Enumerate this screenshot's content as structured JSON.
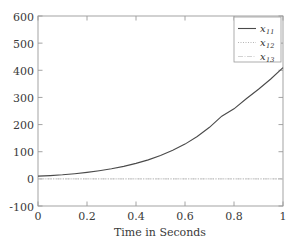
{
  "chart_data": {
    "type": "line",
    "title": "",
    "xlabel": "Time in Seconds",
    "ylabel": "",
    "xlim": [
      0,
      1
    ],
    "ylim": [
      -100,
      600
    ],
    "grid": false,
    "legend_position": "top-right",
    "xticks": [
      "0",
      "0.2",
      "0.4",
      "0.6",
      "0.8",
      "1"
    ],
    "xtick_values": [
      0,
      0.2,
      0.4,
      0.6,
      0.8,
      1
    ],
    "yticks": [
      "600",
      "500",
      "400",
      "300",
      "200",
      "100",
      "0",
      "-100"
    ],
    "ytick_values": [
      600,
      500,
      400,
      300,
      200,
      100,
      0,
      -100
    ],
    "x": [
      0,
      0.05,
      0.1,
      0.15,
      0.2,
      0.25,
      0.3,
      0.35,
      0.4,
      0.45,
      0.5,
      0.55,
      0.6,
      0.65,
      0.7,
      0.75,
      0.8,
      0.85,
      0.9,
      0.95,
      1
    ],
    "series": [
      {
        "name": "x11",
        "label": "x",
        "sub": "11",
        "style": "solid",
        "color": "#4a4a4a",
        "values": [
          10,
          12,
          15,
          19,
          24,
          30,
          37,
          46,
          57,
          70,
          86,
          105,
          128,
          156,
          190,
          231,
          258,
          295,
          330,
          368,
          410
        ]
      },
      {
        "name": "x12",
        "label": "x",
        "sub": "12",
        "style": "dotted",
        "color": "#b5b5b5",
        "values": [
          0,
          0,
          0,
          0,
          0,
          0,
          0,
          0,
          0,
          0,
          0,
          0,
          0,
          0,
          0,
          0,
          0,
          0,
          0,
          0,
          0
        ]
      },
      {
        "name": "x13",
        "label": "x",
        "sub": "13",
        "style": "dashdot",
        "color": "#cccccc",
        "values": [
          0,
          0,
          0,
          0,
          0,
          0,
          0,
          0,
          0,
          0,
          0,
          0,
          0,
          0,
          0,
          0,
          0,
          0,
          0,
          0,
          0
        ]
      }
    ]
  },
  "axes": {
    "frame_color": "#9a9a9a",
    "background": "#ffffff"
  }
}
